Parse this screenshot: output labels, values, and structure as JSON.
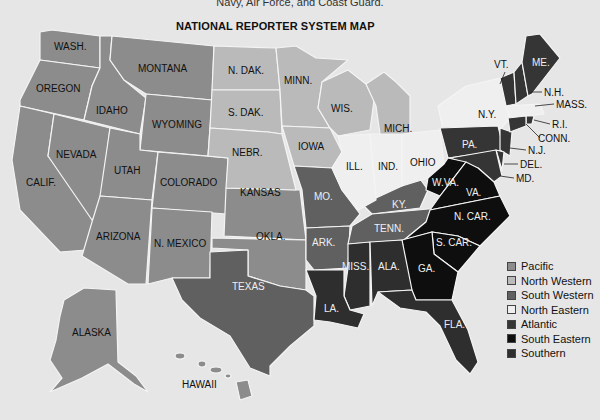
{
  "top_note": "Navy, Air Force, and Coast Guard.",
  "title": "NATIONAL REPORTER SYSTEM MAP",
  "colors": {
    "background": "#e6e6e6",
    "Pacific": "#8c8c8c",
    "North Western": "#bababa",
    "South Western": "#606060",
    "North Eastern": "#efefef",
    "Atlantic": "#353535",
    "South Eastern": "#0e0e0e",
    "Southern": "#2e2e2e"
  },
  "legend": [
    {
      "label": "Pacific",
      "color": "#8c8c8c"
    },
    {
      "label": "North Western",
      "color": "#bababa"
    },
    {
      "label": "South Western",
      "color": "#606060"
    },
    {
      "label": "North Eastern",
      "color": "#efefef"
    },
    {
      "label": "Atlantic",
      "color": "#353535"
    },
    {
      "label": "South Eastern",
      "color": "#0e0e0e"
    },
    {
      "label": "Southern",
      "color": "#2e2e2e"
    }
  ],
  "states": {
    "wash": "WASH.",
    "oregon": "OREGON",
    "calif": "CALIF.",
    "nevada": "NEVADA",
    "idaho": "IDAHO",
    "montana": "MONTANA",
    "wyoming": "WYOMING",
    "utah": "UTAH",
    "colorado": "COLORADO",
    "arizona": "ARIZONA",
    "nmexico": "N. MEXICO",
    "kansas": "KANSAS",
    "okla": "OKLA.",
    "alaska": "ALASKA",
    "hawaii": "HAWAII",
    "ndak": "N. DAK.",
    "sdak": "S. DAK.",
    "nebr": "NEBR.",
    "minn": "MINN.",
    "iowa": "IOWA",
    "wis": "WIS.",
    "mich": "MICH.",
    "texas": "TEXAS",
    "mo": "MO.",
    "ark": "ARK.",
    "ky": "KY.",
    "tenn": "TENN.",
    "ill": "ILL.",
    "ind": "IND.",
    "ohio": "OHIO",
    "ny": "N.Y.",
    "mass": "MASS.",
    "pa": "PA.",
    "nj": "N.J.",
    "del": "DEL.",
    "md": "MD.",
    "vt": "VT.",
    "nh": "N.H.",
    "me": "ME.",
    "ri": "R.I.",
    "conn": "CONN.",
    "wva": "W.VA.",
    "va": "VA.",
    "ncar": "N. CAR.",
    "scar": "S. CAR.",
    "ga": "GA.",
    "miss": "MISS.",
    "ala": "ALA.",
    "fla": "FLA.",
    "la": "LA."
  },
  "state_region": {
    "wash": "Pacific",
    "oregon": "Pacific",
    "calif": "Pacific",
    "nevada": "Pacific",
    "idaho": "Pacific",
    "montana": "Pacific",
    "wyoming": "Pacific",
    "utah": "Pacific",
    "colorado": "Pacific",
    "arizona": "Pacific",
    "nmexico": "Pacific",
    "kansas": "Pacific",
    "okla": "Pacific",
    "alaska": "Pacific",
    "hawaii": "Pacific",
    "ndak": "North Western",
    "sdak": "North Western",
    "nebr": "North Western",
    "minn": "North Western",
    "iowa": "North Western",
    "wis": "North Western",
    "mich": "North Western",
    "texas": "South Western",
    "mo": "South Western",
    "ark": "South Western",
    "ky": "South Western",
    "tenn": "South Western",
    "la": "Southern",
    "ill": "North Eastern",
    "ind": "North Eastern",
    "ohio": "North Eastern",
    "ny": "North Eastern",
    "mass": "North Eastern",
    "pa": "Atlantic",
    "nj": "Atlantic",
    "del": "Atlantic",
    "md": "Atlantic",
    "vt": "Atlantic",
    "nh": "Atlantic",
    "me": "Atlantic",
    "ri": "Atlantic",
    "conn": "Atlantic",
    "wva": "South Eastern",
    "va": "South Eastern",
    "ncar": "South Eastern",
    "scar": "South Eastern",
    "ga": "South Eastern",
    "miss": "Southern",
    "ala": "Southern",
    "fla": "Southern"
  }
}
